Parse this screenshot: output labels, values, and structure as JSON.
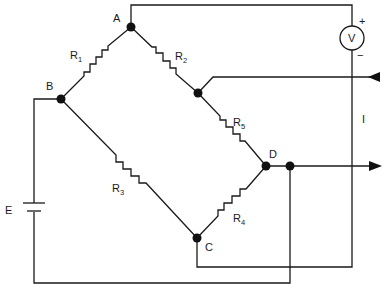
{
  "diagram": {
    "type": "wheatstone-bridge-circuit",
    "nodes": {
      "A": "A",
      "B": "B",
      "C": "C",
      "D": "D"
    },
    "resistors": [
      {
        "id": "R1",
        "letter": "R",
        "sub": "1"
      },
      {
        "id": "R2",
        "letter": "R",
        "sub": "2"
      },
      {
        "id": "R3",
        "letter": "R",
        "sub": "3"
      },
      {
        "id": "R4",
        "letter": "R",
        "sub": "4"
      },
      {
        "id": "R5",
        "letter": "R",
        "sub": "5"
      }
    ],
    "voltmeter": {
      "label": "V",
      "plus": "+",
      "minus": "−"
    },
    "battery": {
      "label": "E"
    },
    "current": {
      "label": "I"
    },
    "colors": {
      "line": "#1a1a1a",
      "background": "#ffffff"
    }
  }
}
